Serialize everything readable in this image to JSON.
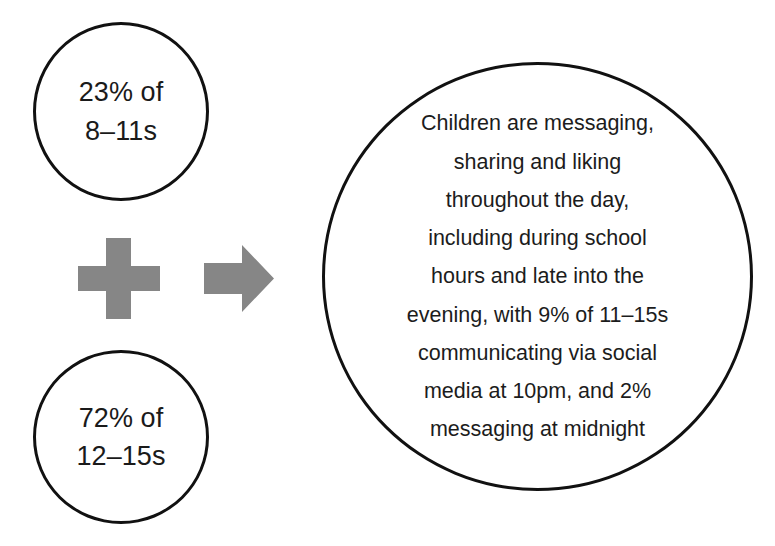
{
  "page": {
    "background_color": "#ffffff"
  },
  "colors": {
    "outline": "#111111",
    "text": "#1a1a1a",
    "symbol_gray": "#868686",
    "background": "#ffffff"
  },
  "stats": [
    {
      "id": "stat-8-11",
      "line1": "23% of",
      "line2": "8–11s",
      "percent": "23%",
      "age_group": "8–11s"
    },
    {
      "id": "stat-12-15",
      "line1": "72% of",
      "line2": "12–15s",
      "percent": "72%",
      "age_group": "12–15s"
    }
  ],
  "symbols": {
    "plus": "plus-sign",
    "arrow": "arrow-right-icon"
  },
  "summary": {
    "full_text": "Children are messaging, sharing and liking throughout the day, including during school hours and late into the evening, with 9% of 11–15s communicating via social media at 10pm, and 2% messaging at midnight",
    "lines": [
      "Children are messaging,",
      "sharing and liking",
      "throughout the day,",
      "including during school",
      "hours and late into the",
      "evening, with 9% of 11–15s",
      "communicating via social",
      "media at 10pm, and 2%",
      "messaging at midnight"
    ]
  }
}
